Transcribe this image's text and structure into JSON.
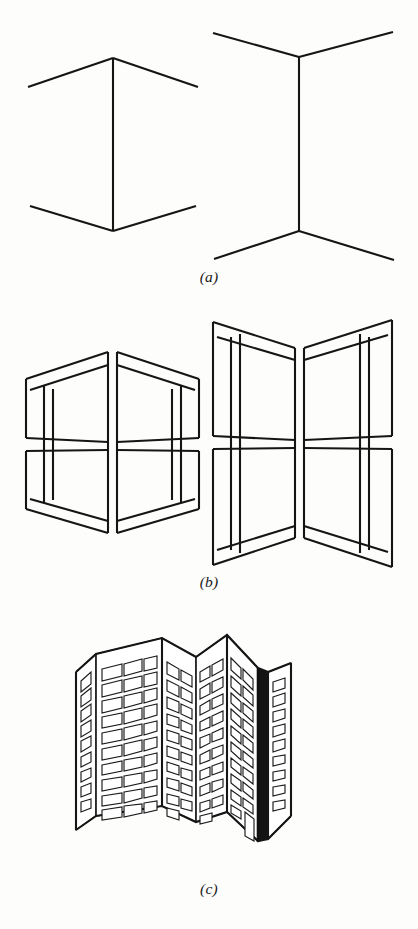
{
  "figure": {
    "background_color": "#fdfdfc",
    "ink_color": "#151515",
    "panels": [
      {
        "id": "a",
        "caption": "(a)",
        "description": "Bare line drawings: a convex corner (left) and a concave corner (right)",
        "subfigures": [
          {
            "name": "convex-corner-lines",
            "kind": "convex",
            "vertical_edge": {
              "x": 113,
              "y_top": 58,
              "y_bottom": 230
            },
            "arms": [
              {
                "from": [
                  113,
                  58
                ],
                "to": [
                  28,
                  87
                ]
              },
              {
                "from": [
                  113,
                  58
                ],
                "to": [
                  198,
                  87
                ]
              },
              {
                "from": [
                  113,
                  230
                ],
                "to": [
                  30,
                  206
                ]
              },
              {
                "from": [
                  113,
                  230
                ],
                "to": [
                  196,
                  206
                ]
              }
            ]
          },
          {
            "name": "concave-corner-lines",
            "kind": "concave",
            "vertical_edge": {
              "x": 299,
              "y_top": 57,
              "y_bottom": 231
            },
            "arms": [
              {
                "from": [
                  299,
                  57
                ],
                "to": [
                  213,
                  33
                ]
              },
              {
                "from": [
                  299,
                  57
                ],
                "to": [
                  393,
                  32
                ]
              },
              {
                "from": [
                  299,
                  231
                ],
                "to": [
                  214,
                  259
                ]
              },
              {
                "from": [
                  299,
                  231
                ],
                "to": [
                  394,
                  260
                ]
              }
            ]
          }
        ]
      },
      {
        "id": "b",
        "caption": "(b)",
        "description": "The same two corners drawn with window mullions, making the convex/concave reading explicit",
        "subfigures": [
          {
            "name": "convex-corner-windows",
            "kind": "convex",
            "rows": 2,
            "columns": 2
          },
          {
            "name": "concave-corner-windows",
            "kind": "concave",
            "rows": 2,
            "columns": 2
          }
        ]
      },
      {
        "id": "c",
        "caption": "(c)",
        "description": "A rendered apartment block with a zig-zag (W-plan) facade containing both convex and concave corners",
        "building": {
          "name": "zigzag-apartment-building",
          "floors": 13,
          "facets": [
            {
              "name": "far-left-return",
              "window_columns": 1,
              "shading": "light"
            },
            {
              "name": "left-main-face",
              "window_columns": 3,
              "shading": "light"
            },
            {
              "name": "inner-left-face",
              "window_columns": 2,
              "shading": "light"
            },
            {
              "name": "inner-right-face",
              "window_columns": 2,
              "shading": "light"
            },
            {
              "name": "shadow-reveal",
              "window_columns": 0,
              "shading": "dark"
            },
            {
              "name": "right-end-face",
              "window_columns": 1,
              "shading": "light"
            }
          ],
          "entrance_door": true,
          "shadow_strip_color": "#141414"
        }
      }
    ]
  }
}
